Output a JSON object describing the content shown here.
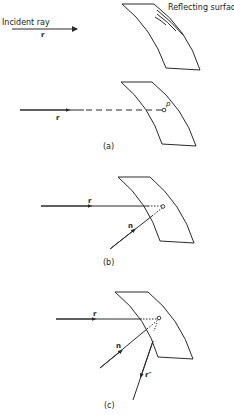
{
  "figure": {
    "labels": {
      "incident_ray": "Incident ray",
      "reflecting_surface": "Reflecting surface",
      "r": "r",
      "n": "n",
      "p": "p",
      "r_double_prime": "r″"
    },
    "panels": [
      {
        "id": "top",
        "caption": ""
      },
      {
        "id": "a",
        "caption": "(a)"
      },
      {
        "id": "b",
        "caption": "(b)"
      },
      {
        "id": "c",
        "caption": "(c)"
      }
    ],
    "colors": {
      "line": "#2a2a2a",
      "background": "#ffffff"
    }
  }
}
